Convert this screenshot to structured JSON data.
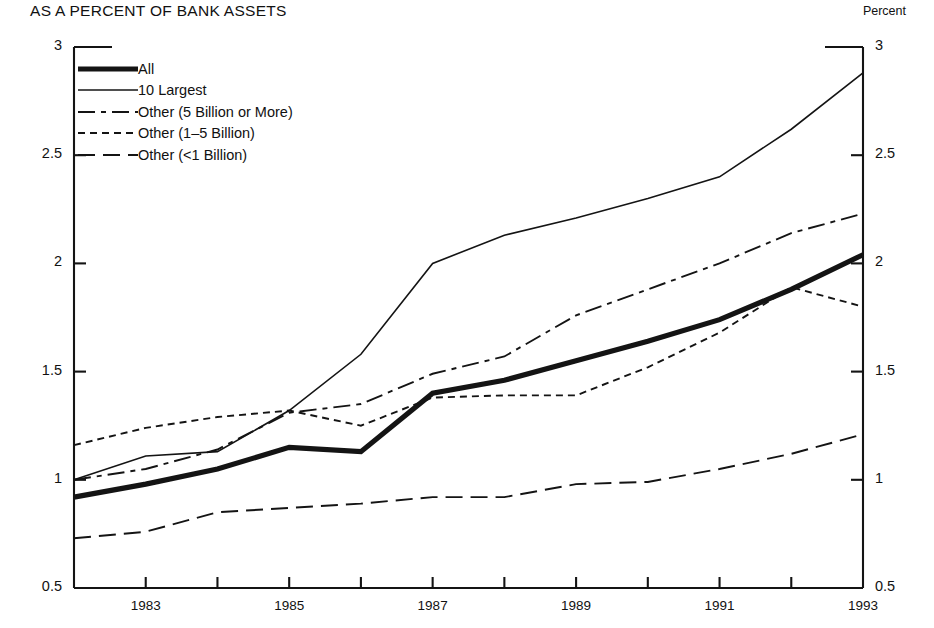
{
  "chart_data": {
    "type": "line",
    "title": "AS A PERCENT OF BANK ASSETS",
    "xlabel": "",
    "ylabel": "",
    "y_axis_unit_label": "Percent",
    "grid": false,
    "legend_position": "upper-left-inside",
    "ylim": [
      0.5,
      3
    ],
    "ytick_labels": [
      "3",
      "2.5",
      "2",
      "1.5",
      "1",
      "0.5"
    ],
    "ytick_values": [
      3,
      2.5,
      2,
      1.5,
      1,
      0.5
    ],
    "dual_axis": true,
    "xlim": [
      1982,
      1993
    ],
    "x": [
      1982,
      1983,
      1984,
      1985,
      1986,
      1987,
      1988,
      1989,
      1990,
      1991,
      1992,
      1993
    ],
    "xtick_values": [
      1982,
      1983,
      1984,
      1985,
      1986,
      1987,
      1988,
      1989,
      1990,
      1991,
      1992,
      1993
    ],
    "xtick_labels": [
      "",
      "1983",
      "",
      "1985",
      "",
      "1987",
      "",
      "1989",
      "",
      "1991",
      "",
      "1993"
    ],
    "series": [
      {
        "name": "All",
        "style": "thick-solid",
        "color": "#141414",
        "values": [
          0.92,
          0.98,
          1.05,
          1.15,
          1.13,
          1.4,
          1.46,
          1.55,
          1.64,
          1.74,
          1.88,
          2.04
        ]
      },
      {
        "name": "10 Largest",
        "style": "thin-solid",
        "color": "#141414",
        "values": [
          1.0,
          1.11,
          1.13,
          1.32,
          1.58,
          2.0,
          2.13,
          2.21,
          2.3,
          2.4,
          2.62,
          2.88
        ]
      },
      {
        "name": "Other (5 Billion or More)",
        "style": "dash-dot",
        "color": "#141414",
        "values": [
          1.0,
          1.05,
          1.14,
          1.31,
          1.35,
          1.49,
          1.57,
          1.76,
          1.88,
          2.0,
          2.14,
          2.23
        ]
      },
      {
        "name": "Other (1–5 Billion)",
        "style": "dotted",
        "color": "#141414",
        "values": [
          1.16,
          1.24,
          1.29,
          1.32,
          1.25,
          1.38,
          1.39,
          1.39,
          1.52,
          1.68,
          1.89,
          1.8
        ]
      },
      {
        "name": "Other (<1 Billion)",
        "style": "long-dash",
        "color": "#141414",
        "values": [
          0.73,
          0.76,
          0.85,
          0.87,
          0.89,
          0.92,
          0.92,
          0.98,
          0.99,
          1.05,
          1.12,
          1.21
        ]
      }
    ]
  }
}
